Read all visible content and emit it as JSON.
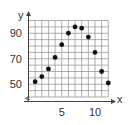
{
  "chart_data": {
    "type": "scatter",
    "title": "",
    "xlabel": "x",
    "ylabel": "y",
    "xlim": [
      0,
      12
    ],
    "ylim": [
      40,
      100
    ],
    "y_axis_break": true,
    "grid": true,
    "grid_step_x": 1,
    "grid_step_y": 5,
    "x_ticks": [
      {
        "value": 5,
        "label": "5"
      },
      {
        "value": 10,
        "label": "10"
      }
    ],
    "y_ticks": [
      {
        "value": 50,
        "label": "50"
      },
      {
        "value": 70,
        "label": "70"
      },
      {
        "value": 90,
        "label": "90"
      }
    ],
    "series": [
      {
        "name": "points",
        "x": [
          1,
          2,
          3,
          4,
          5,
          6,
          7,
          8,
          9,
          10,
          11,
          12
        ],
        "y": [
          52,
          56,
          62,
          71,
          81,
          90,
          95,
          94,
          87,
          75,
          60,
          51
        ]
      }
    ],
    "colors": {
      "grid": "#9a9a9a",
      "axis": "#444444",
      "point": "#111111"
    }
  }
}
